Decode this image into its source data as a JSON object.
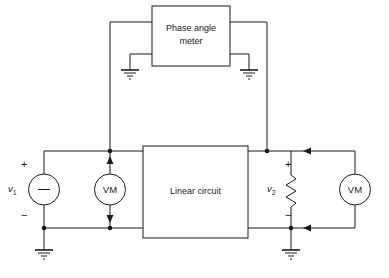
{
  "diagram": {
    "stroke_color": "#1a1a1a",
    "background_color": "#ffffff"
  },
  "blocks": {
    "phase_meter": {
      "label_line1": "Phase angle",
      "label_line2": "meter",
      "name": "phase-angle-meter-block"
    },
    "linear_circuit": {
      "label": "Linear circuit",
      "name": "linear-circuit-block"
    }
  },
  "meters": {
    "left_voltmeter": {
      "label": "VM"
    },
    "right_voltmeter": {
      "label": "VM"
    }
  },
  "sources": {
    "v1": {
      "label": "v",
      "subscript": "1",
      "plus": "+",
      "minus": "−",
      "symbol": "−"
    }
  },
  "loads": {
    "v2": {
      "label": "v",
      "subscript": "2",
      "plus": "+",
      "minus": "−"
    }
  },
  "grounds": {
    "count": 4,
    "names": [
      "ground-source-left",
      "ground-phase-meter-left",
      "ground-phase-meter-right",
      "ground-load-right"
    ]
  },
  "icons": {
    "ground": "ground-icon",
    "resistor": "resistor-icon",
    "voltage-source": "voltage-source-icon",
    "junction-dot": "junction-dot-icon",
    "arrow": "arrow-icon"
  }
}
